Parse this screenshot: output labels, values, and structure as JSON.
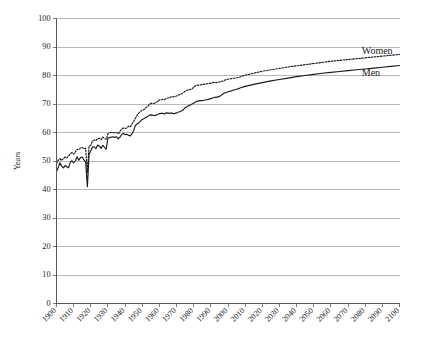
{
  "chart_data": {
    "type": "line",
    "title": "",
    "subtitle": "",
    "xlabel": "",
    "ylabel": "Years",
    "xlim": [
      1900,
      2100
    ],
    "ylim": [
      0,
      100
    ],
    "grid": true,
    "grid_axis": "y",
    "legend_position": "inline-right-end",
    "x_tick_labels": [
      "1900",
      "1910",
      "1920",
      "1930",
      "1940",
      "1950",
      "1960",
      "1970",
      "1980",
      "1990",
      "2000",
      "2010",
      "2020",
      "2030",
      "2040",
      "2050",
      "2060",
      "2070",
      "2080",
      "2090",
      "2100"
    ],
    "x_tick_values": [
      1900,
      1910,
      1920,
      1930,
      1940,
      1950,
      1960,
      1970,
      1980,
      1990,
      2000,
      2010,
      2020,
      2030,
      2040,
      2050,
      2060,
      2070,
      2080,
      2090,
      2100
    ],
    "y_tick_labels": [
      "0",
      "10",
      "20",
      "30",
      "40",
      "50",
      "60",
      "70",
      "80",
      "90",
      "100"
    ],
    "y_tick_values": [
      0,
      10,
      20,
      30,
      40,
      50,
      60,
      70,
      80,
      90,
      100
    ],
    "annotations": [
      {
        "text": "Women",
        "x": 2078,
        "y": 87.5
      },
      {
        "text": "Men",
        "x": 2078,
        "y": 79.8
      }
    ],
    "series": [
      {
        "name": "Women",
        "style": "dotted",
        "color": "#1a1a1a",
        "x": [
          1900,
          1901,
          1902,
          1903,
          1904,
          1905,
          1906,
          1907,
          1908,
          1909,
          1910,
          1911,
          1912,
          1913,
          1914,
          1915,
          1916,
          1917,
          1918,
          1919,
          1920,
          1921,
          1922,
          1923,
          1924,
          1925,
          1926,
          1927,
          1928,
          1929,
          1930,
          1931,
          1932,
          1933,
          1934,
          1935,
          1936,
          1937,
          1938,
          1939,
          1940,
          1941,
          1942,
          1943,
          1944,
          1945,
          1946,
          1947,
          1948,
          1949,
          1950,
          1951,
          1952,
          1953,
          1954,
          1955,
          1956,
          1957,
          1958,
          1959,
          1960,
          1961,
          1962,
          1963,
          1964,
          1965,
          1966,
          1967,
          1968,
          1969,
          1970,
          1971,
          1972,
          1973,
          1974,
          1975,
          1976,
          1977,
          1978,
          1979,
          1980,
          1981,
          1982,
          1983,
          1984,
          1985,
          1986,
          1987,
          1988,
          1989,
          1990,
          1991,
          1992,
          1993,
          1994,
          1995,
          1996,
          1997,
          1998,
          1999,
          2000,
          2001,
          2002,
          2003,
          2004,
          2005,
          2006,
          2007,
          2008,
          2009,
          2010,
          2015,
          2020,
          2025,
          2030,
          2035,
          2040,
          2045,
          2050,
          2055,
          2060,
          2065,
          2070,
          2075,
          2080,
          2085,
          2090,
          2095,
          2100
        ],
        "y": [
          49.0,
          50.3,
          50.8,
          50.2,
          50.9,
          51.4,
          51.1,
          51.8,
          52.5,
          53.0,
          52.4,
          53.2,
          54.1,
          54.0,
          54.6,
          54.8,
          54.3,
          54.5,
          46.0,
          55.3,
          55.6,
          57.0,
          57.4,
          57.2,
          57.8,
          58.0,
          57.5,
          58.4,
          57.9,
          57.6,
          59.6,
          59.9,
          60.0,
          59.9,
          60.0,
          60.0,
          59.6,
          60.4,
          61.3,
          61.6,
          61.4,
          61.6,
          62.2,
          62.0,
          63.0,
          63.8,
          65.0,
          66.0,
          66.8,
          67.3,
          67.9,
          68.0,
          68.7,
          69.0,
          69.8,
          70.2,
          70.3,
          70.2,
          70.6,
          70.9,
          71.4,
          71.5,
          71.6,
          71.5,
          72.0,
          72.1,
          72.2,
          72.6,
          72.5,
          72.6,
          72.8,
          73.2,
          73.3,
          73.6,
          74.0,
          74.5,
          74.8,
          75.0,
          75.1,
          75.3,
          76.0,
          76.4,
          76.6,
          76.6,
          76.7,
          76.8,
          76.9,
          77.0,
          77.1,
          77.2,
          77.3,
          77.5,
          77.6,
          77.5,
          77.6,
          77.7,
          77.9,
          78.0,
          78.3,
          78.6,
          78.7,
          78.8,
          78.9,
          79.0,
          79.1,
          79.2,
          79.3,
          79.5,
          79.7,
          79.9,
          80.1,
          80.8,
          81.5,
          82.0,
          82.5,
          83.0,
          83.4,
          83.8,
          84.2,
          84.6,
          85.0,
          85.3,
          85.6,
          85.9,
          86.2,
          86.5,
          86.8,
          87.1,
          87.4
        ]
      },
      {
        "name": "Men",
        "style": "solid",
        "color": "#1a1a1a",
        "x": [
          1900,
          1901,
          1902,
          1903,
          1904,
          1905,
          1906,
          1907,
          1908,
          1909,
          1910,
          1911,
          1912,
          1913,
          1914,
          1915,
          1916,
          1917,
          1918,
          1919,
          1920,
          1921,
          1922,
          1923,
          1924,
          1925,
          1926,
          1927,
          1928,
          1929,
          1930,
          1931,
          1932,
          1933,
          1934,
          1935,
          1936,
          1937,
          1938,
          1939,
          1940,
          1941,
          1942,
          1943,
          1944,
          1945,
          1946,
          1947,
          1948,
          1949,
          1950,
          1951,
          1952,
          1953,
          1954,
          1955,
          1956,
          1957,
          1958,
          1959,
          1960,
          1961,
          1962,
          1963,
          1964,
          1965,
          1966,
          1967,
          1968,
          1969,
          1970,
          1971,
          1972,
          1973,
          1974,
          1975,
          1976,
          1977,
          1978,
          1979,
          1980,
          1981,
          1982,
          1983,
          1984,
          1985,
          1986,
          1987,
          1988,
          1989,
          1990,
          1991,
          1992,
          1993,
          1994,
          1995,
          1996,
          1997,
          1998,
          1999,
          2000,
          2001,
          2002,
          2003,
          2004,
          2005,
          2006,
          2007,
          2008,
          2009,
          2010,
          2015,
          2020,
          2025,
          2030,
          2035,
          2040,
          2045,
          2050,
          2055,
          2060,
          2065,
          2070,
          2075,
          2080,
          2085,
          2090,
          2095,
          2100
        ],
        "y": [
          46.3,
          47.6,
          49.4,
          48.2,
          47.6,
          48.4,
          48.0,
          47.6,
          49.5,
          50.1,
          49.3,
          50.0,
          51.5,
          50.3,
          51.2,
          51.4,
          50.4,
          49.6,
          41.0,
          52.3,
          53.6,
          54.9,
          55.0,
          54.3,
          55.6,
          55.2,
          54.4,
          55.5,
          54.8,
          54.2,
          58.1,
          58.2,
          58.4,
          58.5,
          58.3,
          58.5,
          57.8,
          58.4,
          59.3,
          59.7,
          59.2,
          59.4,
          59.0,
          58.8,
          59.5,
          60.7,
          62.5,
          63.0,
          63.4,
          64.0,
          64.6,
          64.8,
          65.3,
          65.5,
          66.0,
          66.2,
          66.1,
          65.9,
          66.1,
          66.3,
          66.6,
          66.7,
          66.7,
          66.5,
          66.9,
          66.8,
          66.7,
          66.9,
          66.6,
          66.7,
          66.8,
          67.2,
          67.3,
          67.6,
          68.0,
          68.7,
          69.0,
          69.4,
          69.6,
          70.0,
          70.3,
          70.7,
          71.0,
          71.1,
          71.2,
          71.2,
          71.3,
          71.5,
          71.5,
          71.7,
          71.9,
          72.1,
          72.3,
          72.3,
          72.5,
          72.6,
          73.1,
          73.5,
          73.9,
          74.0,
          74.3,
          74.5,
          74.6,
          74.8,
          75.0,
          75.2,
          75.4,
          75.6,
          75.8,
          76.0,
          76.2,
          76.9,
          77.5,
          78.1,
          78.6,
          79.1,
          79.6,
          80.0,
          80.4,
          80.8,
          81.1,
          81.4,
          81.7,
          82.0,
          82.3,
          82.6,
          82.9,
          83.2,
          83.5
        ]
      }
    ]
  },
  "colors": {
    "line": "#1a1a1a",
    "gridline": "#a6a6a6",
    "axis": "#595959",
    "background": "#ffffff",
    "text": "#1a1a1a"
  }
}
